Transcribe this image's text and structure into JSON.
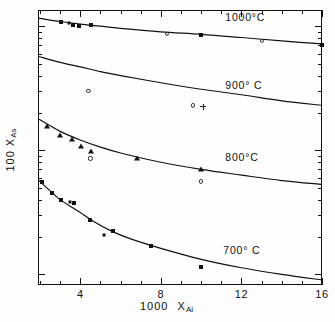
{
  "chart_data": {
    "type": "scatter",
    "title": "",
    "xlabel": "1000 X_Al",
    "xlabel_main": "1000",
    "xlabel_sub": "Al",
    "xlabel_var": "X",
    "ylabel": "100 X_As",
    "ylabel_main": "100",
    "ylabel_var": "X",
    "ylabel_sub": "As",
    "xscale": "linear",
    "yscale": "log",
    "xlim": [
      1.9,
      16
    ],
    "ylim": [
      0.082,
      13.5
    ],
    "grid": false,
    "legend": "inline-curve-labels",
    "xticks_major": [
      4,
      8,
      12,
      16
    ],
    "xtick_labels": [
      "4",
      "8",
      "12",
      "16"
    ],
    "xticks_minor": [
      2,
      3,
      5,
      6,
      7,
      9,
      10,
      11,
      13,
      14,
      15
    ],
    "yticks_major": [
      10,
      1.0,
      0.1
    ],
    "ytick_labels": [
      "10",
      "1.0",
      "0.1"
    ],
    "curve_labels": [
      {
        "text": "1000°C",
        "x": 11.2,
        "y": 11.6
      },
      {
        "text": "900° C",
        "x": 11.2,
        "y": 3.3
      },
      {
        "text": "800°C",
        "x": 11.2,
        "y": 0.86
      },
      {
        "text": "700° C",
        "x": 11.1,
        "y": 0.155
      }
    ],
    "series": [
      {
        "name": "1000°C",
        "label": "1000°C",
        "curve": [
          [
            1.95,
            11.6
          ],
          [
            3,
            10.9
          ],
          [
            4,
            10.4
          ],
          [
            5,
            10.0
          ],
          [
            6,
            9.6
          ],
          [
            8,
            9.0
          ],
          [
            10,
            8.6
          ],
          [
            12,
            8.1
          ],
          [
            14,
            7.6
          ],
          [
            16,
            7.2
          ]
        ],
        "points": [
          {
            "x": 3.05,
            "y": 10.9,
            "marker": "filled-square"
          },
          {
            "x": 3.45,
            "y": 10.6,
            "marker": "filled-square-small"
          },
          {
            "x": 3.62,
            "y": 10.3,
            "marker": "filled-square"
          },
          {
            "x": 3.95,
            "y": 10.1,
            "marker": "filled-square"
          },
          {
            "x": 4.55,
            "y": 10.3,
            "marker": "filled-square"
          },
          {
            "x": 8.3,
            "y": 8.6,
            "marker": "open-circle"
          },
          {
            "x": 10.0,
            "y": 8.5,
            "marker": "filled-square"
          },
          {
            "x": 13.0,
            "y": 7.6,
            "marker": "open-circle"
          },
          {
            "x": 16.0,
            "y": 7.1,
            "marker": "filled-square"
          }
        ]
      },
      {
        "name": "900°C",
        "label": "900° C",
        "curve": [
          [
            1.95,
            5.7
          ],
          [
            3,
            5.1
          ],
          [
            4,
            4.7
          ],
          [
            5,
            4.3
          ],
          [
            6,
            4.0
          ],
          [
            8,
            3.5
          ],
          [
            10,
            3.1
          ],
          [
            12,
            2.8
          ],
          [
            14,
            2.5
          ],
          [
            16,
            2.3
          ]
        ],
        "points": [
          {
            "x": 4.4,
            "y": 3.0,
            "marker": "open-circle"
          },
          {
            "x": 9.6,
            "y": 2.3,
            "marker": "open-circle"
          },
          {
            "x": 10.1,
            "y": 2.25,
            "marker": "plus"
          }
        ]
      },
      {
        "name": "800°C",
        "label": "800°C",
        "curve": [
          [
            1.95,
            1.78
          ],
          [
            3,
            1.42
          ],
          [
            4,
            1.21
          ],
          [
            5,
            1.06
          ],
          [
            6,
            0.95
          ],
          [
            8,
            0.8
          ],
          [
            10,
            0.7
          ],
          [
            12,
            0.63
          ],
          [
            14,
            0.57
          ],
          [
            16,
            0.53
          ]
        ],
        "points": [
          {
            "x": 2.35,
            "y": 1.57,
            "marker": "filled-triangle"
          },
          {
            "x": 3.0,
            "y": 1.33,
            "marker": "filled-triangle"
          },
          {
            "x": 3.6,
            "y": 1.23,
            "marker": "filled-triangle"
          },
          {
            "x": 4.05,
            "y": 1.09,
            "marker": "filled-triangle"
          },
          {
            "x": 4.55,
            "y": 0.99,
            "marker": "filled-triangle"
          },
          {
            "x": 4.5,
            "y": 0.86,
            "marker": "open-circle"
          },
          {
            "x": 6.8,
            "y": 0.87,
            "marker": "filled-triangle"
          },
          {
            "x": 10.0,
            "y": 0.7,
            "marker": "filled-triangle"
          },
          {
            "x": 10.0,
            "y": 0.56,
            "marker": "open-circle"
          }
        ]
      },
      {
        "name": "700°C",
        "label": "700° C",
        "curve": [
          [
            1.95,
            0.57
          ],
          [
            2.5,
            0.47
          ],
          [
            3,
            0.4
          ],
          [
            3.6,
            0.345
          ],
          [
            4,
            0.315
          ],
          [
            4.6,
            0.27
          ],
          [
            5.5,
            0.225
          ],
          [
            6.5,
            0.193
          ],
          [
            8,
            0.162
          ],
          [
            10,
            0.132
          ],
          [
            12,
            0.113
          ],
          [
            14,
            0.1
          ],
          [
            16,
            0.09
          ]
        ],
        "points": [
          {
            "x": 2.1,
            "y": 0.555,
            "marker": "filled-square"
          },
          {
            "x": 2.6,
            "y": 0.455,
            "marker": "filled-square"
          },
          {
            "x": 3.05,
            "y": 0.395,
            "marker": "filled-square"
          },
          {
            "x": 3.5,
            "y": 0.385,
            "marker": "filled-square-small"
          },
          {
            "x": 3.7,
            "y": 0.375,
            "marker": "filled-square"
          },
          {
            "x": 4.5,
            "y": 0.272,
            "marker": "filled-square"
          },
          {
            "x": 5.6,
            "y": 0.222,
            "marker": "filled-square"
          },
          {
            "x": 5.2,
            "y": 0.208,
            "marker": "dot"
          },
          {
            "x": 7.5,
            "y": 0.168,
            "marker": "filled-square"
          },
          {
            "x": 10.0,
            "y": 0.115,
            "marker": "filled-square"
          }
        ]
      }
    ]
  }
}
